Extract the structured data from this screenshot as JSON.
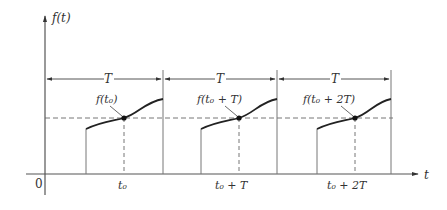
{
  "diagram": {
    "y_axis_label": "f(t)",
    "x_axis_label": "t",
    "origin_label": "0",
    "period_label": "T",
    "periods": [
      {
        "point_label": "f(t₀)",
        "tick_label": "t₀"
      },
      {
        "point_label": "f(t₀ + T)",
        "tick_label": "t₀ + T"
      },
      {
        "point_label": "f(t₀ + 2T)",
        "tick_label": "t₀ + 2T"
      }
    ],
    "colors": {
      "line": "#333333",
      "background": "#ffffff"
    }
  }
}
